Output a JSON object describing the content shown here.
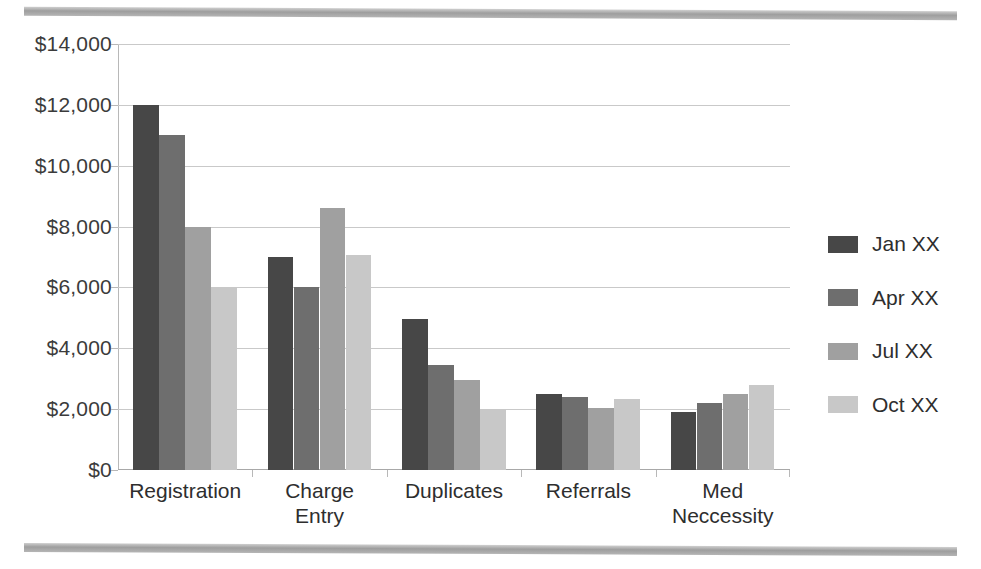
{
  "decor": {
    "top_rule": "page-edge-rule",
    "bottom_rule": "page-edge-rule"
  },
  "chart_data": {
    "type": "bar",
    "title": "",
    "xlabel": "",
    "ylabel": "",
    "ylim": [
      0,
      14000
    ],
    "ytick_step": 2000,
    "ytick_labels": [
      "$0",
      "$2,000",
      "$4,000",
      "$6,000",
      "$8,000",
      "$10,000",
      "$12,000",
      "$14,000"
    ],
    "ytick_values": [
      0,
      2000,
      4000,
      6000,
      8000,
      10000,
      12000,
      14000
    ],
    "grid": true,
    "legend_position": "right",
    "categories": [
      "Registration",
      "Charge Entry",
      "Duplicates",
      "Referrals",
      "Med Neccessity"
    ],
    "category_lines": [
      [
        "Registration"
      ],
      [
        "Charge",
        "Entry"
      ],
      [
        "Duplicates"
      ],
      [
        "Referrals"
      ],
      [
        "Med",
        "Neccessity"
      ]
    ],
    "series": [
      {
        "name": "Jan XX",
        "color": "#474747",
        "values": [
          12000,
          7000,
          4950,
          2500,
          1900
        ]
      },
      {
        "name": "Apr XX",
        "color": "#6e6e6e",
        "values": [
          11000,
          6000,
          3450,
          2400,
          2200
        ]
      },
      {
        "name": "Jul XX",
        "color": "#a0a0a0",
        "values": [
          8000,
          8600,
          2950,
          2050,
          2500
        ]
      },
      {
        "name": "Oct XX",
        "color": "#c8c8c8",
        "values": [
          6000,
          7050,
          2000,
          2350,
          2800
        ]
      }
    ]
  }
}
